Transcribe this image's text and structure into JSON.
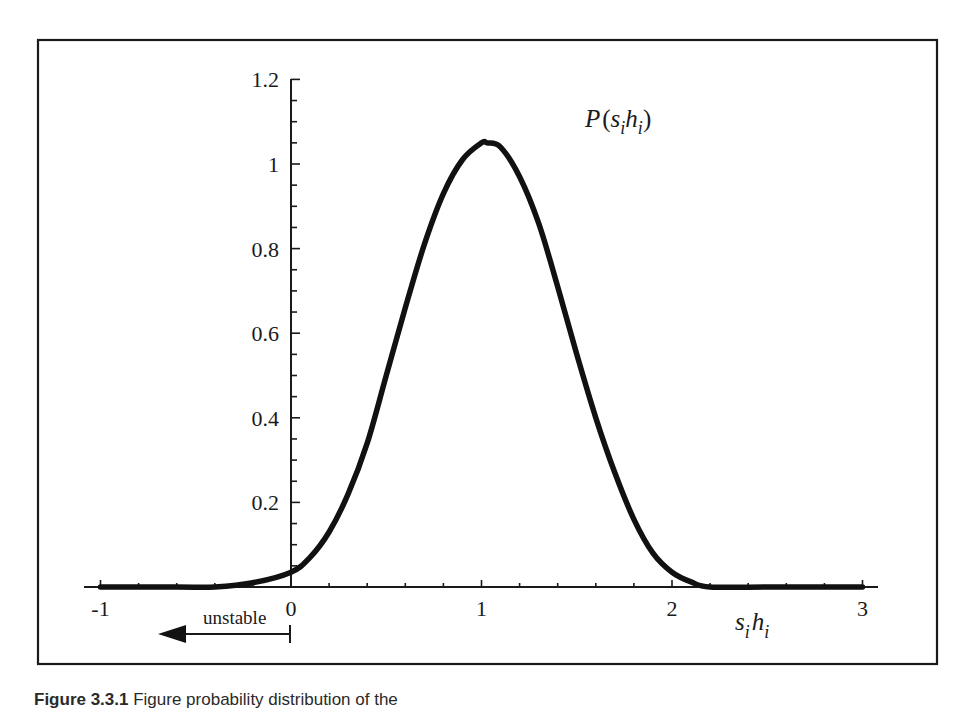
{
  "chart_data": {
    "type": "line",
    "title": "",
    "curve_label": "P(s_i h_i)",
    "xlabel": "s_i h_i",
    "ylabel": "",
    "xlim": [
      -1.1,
      3.1
    ],
    "ylim": [
      0,
      1.2
    ],
    "x_ticks": [
      -1,
      0,
      1,
      2,
      3
    ],
    "x_tick_labels": [
      "-1",
      "0",
      "1",
      "2",
      "3"
    ],
    "x_minor_step": 0.2,
    "y_ticks": [
      0.2,
      0.4,
      0.6,
      0.8,
      1,
      1.2
    ],
    "y_tick_labels": [
      "0.2",
      "0.4",
      "0.6",
      "0.8",
      "1",
      "1.2"
    ],
    "y_minor_step": 0.05,
    "grid": false,
    "legend": null,
    "series": [
      {
        "name": "P(s_i h_i)",
        "x": [
          -1.0,
          -0.6,
          -0.4,
          -0.2,
          0.0,
          0.1,
          0.2,
          0.3,
          0.4,
          0.5,
          0.6,
          0.7,
          0.8,
          0.9,
          1.0,
          1.03,
          1.1,
          1.2,
          1.3,
          1.4,
          1.5,
          1.6,
          1.7,
          1.8,
          1.9,
          2.0,
          2.1,
          2.2,
          2.5,
          3.0
        ],
        "y": [
          0.0,
          0.0,
          0.0,
          0.01,
          0.035,
          0.07,
          0.13,
          0.22,
          0.34,
          0.5,
          0.66,
          0.81,
          0.93,
          1.01,
          1.05,
          1.05,
          1.04,
          0.97,
          0.86,
          0.71,
          0.55,
          0.4,
          0.27,
          0.16,
          0.08,
          0.035,
          0.012,
          0.0,
          0.0,
          0.0
        ]
      }
    ],
    "annotations": [
      {
        "text": "unstable",
        "type": "arrow",
        "from_x": 0,
        "to_x": -0.65,
        "direction": "left"
      }
    ]
  },
  "labels": {
    "curve_P": "P",
    "curve_open": "(",
    "curve_s": "s",
    "curve_i1": "i",
    "curve_h": "h",
    "curve_i2": "i",
    "curve_close": ")",
    "xaxis_s": "s",
    "xaxis_i1": "i",
    "xaxis_h": "h",
    "xaxis_i2": "i",
    "unstable": "unstable"
  },
  "caption": {
    "prefix": "Figure 3.3.1",
    "text": " Figure probability distribution of the"
  }
}
